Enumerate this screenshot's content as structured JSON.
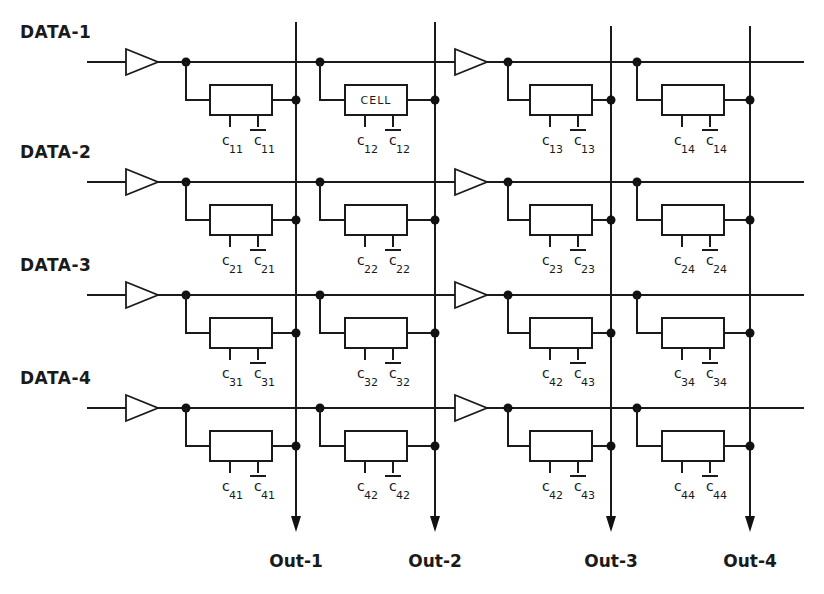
{
  "diagram": {
    "title_cut": "",
    "data_lines": [
      {
        "label": "DATA-1",
        "y": 62
      },
      {
        "label": "DATA-2",
        "y": 182
      },
      {
        "label": "DATA-3",
        "y": 295
      },
      {
        "label": "DATA-4",
        "y": 408
      }
    ],
    "outputs": [
      {
        "label": "Out-1",
        "x": 296
      },
      {
        "label": "Out-2",
        "x": 435
      },
      {
        "label": "Out-3",
        "x": 611
      },
      {
        "label": "Out-4",
        "x": 750
      }
    ],
    "buffer_columns": [
      126,
      455
    ],
    "cells": [
      [
        {
          "text": "",
          "c": "11",
          "cbar": "11"
        },
        {
          "text": "CELL",
          "c": "12",
          "cbar": "12"
        },
        {
          "text": "",
          "c": "13",
          "cbar": "13"
        },
        {
          "text": "",
          "c": "14",
          "cbar": "14"
        }
      ],
      [
        {
          "text": "",
          "c": "21",
          "cbar": "21"
        },
        {
          "text": "",
          "c": "22",
          "cbar": "22"
        },
        {
          "text": "",
          "c": "23",
          "cbar": "23"
        },
        {
          "text": "",
          "c": "24",
          "cbar": "24"
        }
      ],
      [
        {
          "text": "",
          "c": "31",
          "cbar": "31"
        },
        {
          "text": "",
          "c": "32",
          "cbar": "32"
        },
        {
          "text": "",
          "c": "42",
          "cbar": "43"
        },
        {
          "text": "",
          "c": "34",
          "cbar": "34"
        }
      ],
      [
        {
          "text": "",
          "c": "41",
          "cbar": "41"
        },
        {
          "text": "",
          "c": "42",
          "cbar": "42"
        },
        {
          "text": "",
          "c": "42",
          "cbar": "43"
        },
        {
          "text": "",
          "c": "44",
          "cbar": "44"
        }
      ]
    ],
    "c_letter": "c",
    "colors": {
      "ink": "#1a1a1a",
      "background": "#ffffff"
    }
  }
}
